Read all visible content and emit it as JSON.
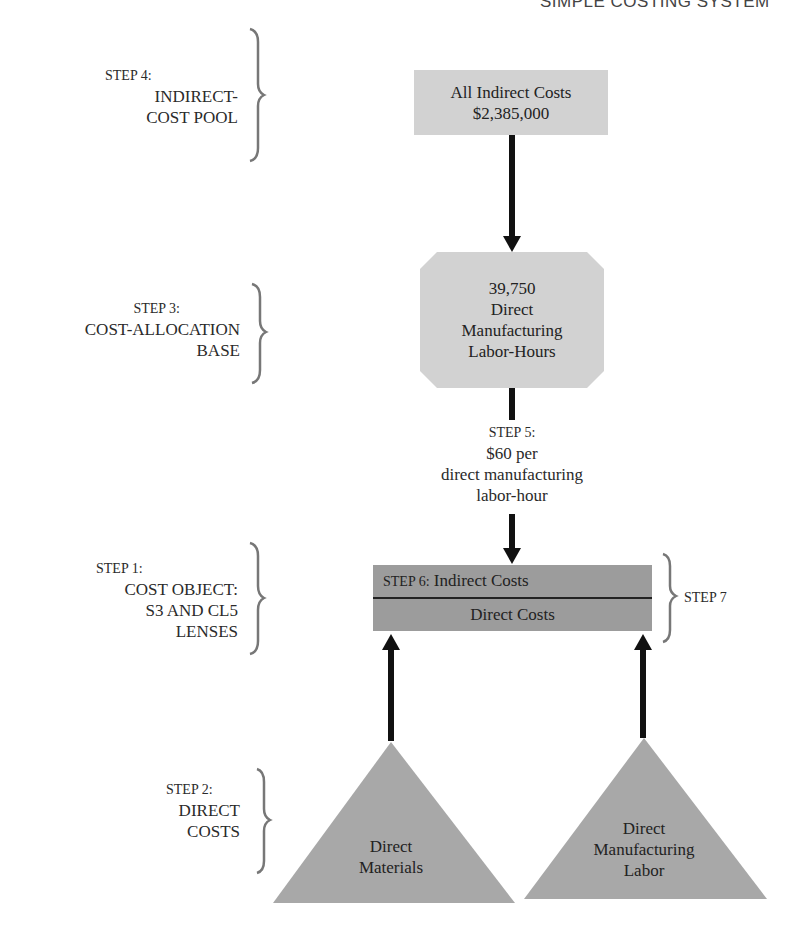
{
  "header": {
    "title": "SIMPLE COSTING SYSTEM"
  },
  "steps": {
    "step4": {
      "step": "STEP 4:",
      "lines": [
        "INDIRECT-",
        "COST POOL"
      ]
    },
    "step3": {
      "step": "STEP 3:",
      "lines": [
        "COST-ALLOCATION",
        "BASE"
      ]
    },
    "step5": {
      "step": "STEP 5:",
      "lines": [
        "$60 per",
        "direct manufacturing",
        "labor-hour"
      ]
    },
    "step1": {
      "step": "STEP 1:",
      "lines": [
        "COST OBJECT:",
        "S3 AND CL5",
        "LENSES"
      ]
    },
    "step2": {
      "step": "STEP 2:",
      "lines": [
        "DIRECT",
        "COSTS"
      ]
    },
    "step6": {
      "step": "STEP 6:",
      "label": "Indirect Costs"
    },
    "step7": {
      "step": "STEP 7"
    }
  },
  "nodes": {
    "indirect_pool": {
      "line1": "All Indirect Costs",
      "line2": "$2,385,000"
    },
    "allocation_base": {
      "lines": [
        "39,750",
        "Direct",
        "Manufacturing",
        "Labor-Hours"
      ]
    },
    "cost_object": {
      "indirect": "Indirect Costs",
      "direct": "Direct Costs"
    },
    "direct_materials": {
      "lines": [
        "Direct",
        "Materials"
      ]
    },
    "direct_labor": {
      "lines": [
        "Direct",
        "Manufacturing",
        "Labor"
      ]
    }
  },
  "colors": {
    "light_box": "#d2d2d2",
    "dark_box": "#9c9c9c",
    "triangle": "#a8a8a8",
    "arrow": "#111111",
    "brace": "#777777"
  }
}
